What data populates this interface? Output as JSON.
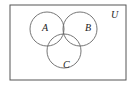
{
  "diagram": {
    "type": "venn",
    "universe_label": "U",
    "sets": [
      {
        "label": "A",
        "cx": 47,
        "cy": 29,
        "r": 17
      },
      {
        "label": "B",
        "cx": 80,
        "cy": 29,
        "r": 17
      },
      {
        "label": "C",
        "cx": 64,
        "cy": 51,
        "r": 17
      }
    ],
    "stroke_color": "#555555",
    "background": "#ffffff"
  }
}
